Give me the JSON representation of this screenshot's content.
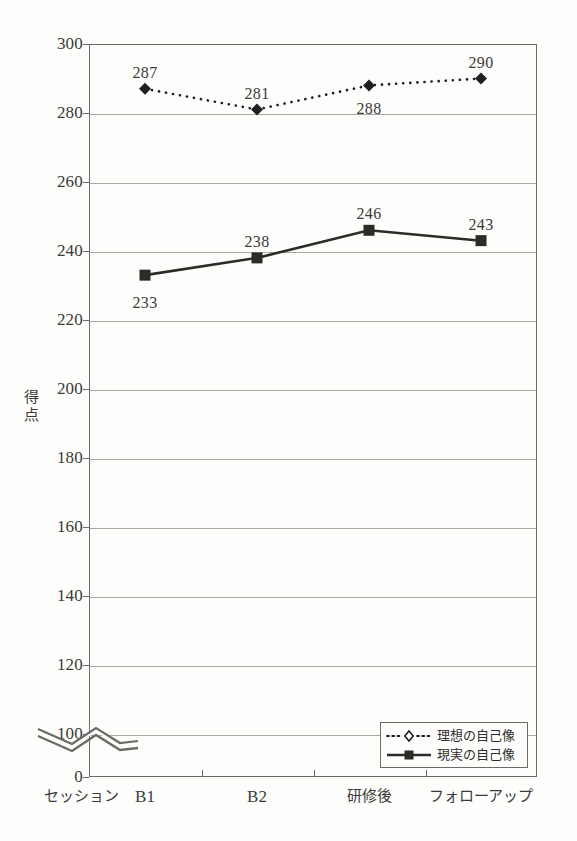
{
  "chart_data": {
    "type": "line",
    "title": "",
    "subtitle": "",
    "xlabel": "セッション",
    "ylabel": "得点",
    "categories": [
      "B1",
      "B2",
      "研修後",
      "フォローアップ"
    ],
    "series": [
      {
        "name": "理想の自己像",
        "values": [
          287,
          281,
          288,
          290
        ],
        "marker": "diamond",
        "line_style": "dotted",
        "color": "#1f1f1d"
      },
      {
        "name": "現実の自己像",
        "values": [
          233,
          238,
          246,
          243
        ],
        "marker": "square",
        "line_style": "solid",
        "color": "#2b2b28"
      }
    ],
    "ylim": [
      0,
      300
    ],
    "y_ticks": [
      0,
      100,
      120,
      140,
      160,
      180,
      200,
      220,
      240,
      260,
      280,
      300
    ],
    "y_tick_labels": [
      "0",
      "100",
      "120",
      "140",
      "160",
      "180",
      "200",
      "220",
      "240",
      "260",
      "280",
      "300"
    ],
    "axis_break": true,
    "axis_break_between": [
      0,
      100
    ],
    "grid": true,
    "grid_axis": "y",
    "legend_position": "bottom-right",
    "data_labels_shown": true,
    "series_0_labels": [
      "287",
      "281",
      "288",
      "290"
    ],
    "series_1_labels": [
      "233",
      "238",
      "246",
      "243"
    ]
  },
  "axis": {
    "y_title_chars": [
      "得",
      "点"
    ],
    "x_axis_name": "セッション"
  },
  "legend": {
    "items": [
      {
        "label": "理想の自己像",
        "key": "dotted-open-diamond"
      },
      {
        "label": "現実の自己像",
        "key": "solid-filled-square"
      }
    ]
  },
  "colors": {
    "axis": "#6b6b68",
    "grid": "#a9a9a4",
    "text": "#3a3a38",
    "series_ideal": "#1f1f1d",
    "series_real": "#2b2b28",
    "background": "#fdfdfc"
  }
}
